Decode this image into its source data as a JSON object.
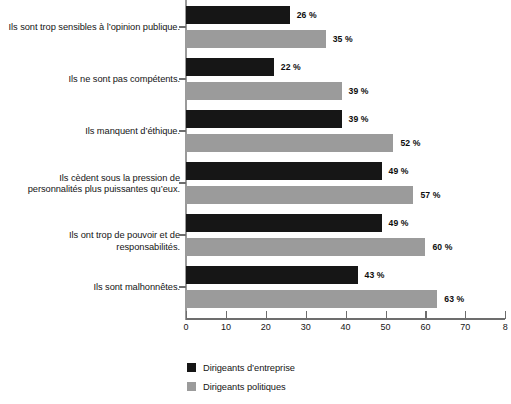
{
  "chart_data": {
    "type": "bar",
    "orientation": "horizontal",
    "title": "",
    "xlabel": "",
    "ylabel": "",
    "xlim": [
      0,
      80
    ],
    "xticks": [
      0,
      10,
      20,
      30,
      40,
      50,
      60,
      70,
      80
    ],
    "xtick_labels": [
      "0",
      "10",
      "20",
      "30",
      "40",
      "50",
      "60",
      "70",
      "8"
    ],
    "grid": false,
    "legend_position": "bottom-left",
    "value_suffix": "%",
    "categories": [
      "Ils sont trop sensibles à l’opinion publique.",
      "Ils ne sont pas compétents.",
      "Ils manquent d’éthique.",
      "Ils cèdent sous la pression de\npersonnalités plus puissantes qu’eux.",
      "Ils ont trop de pouvoir et de responsabilités.",
      "Ils sont malhonnêtes."
    ],
    "series": [
      {
        "name": "Dirigeants d’entreprise",
        "color": "#161616",
        "values": [
          26,
          22,
          39,
          49,
          49,
          43
        ],
        "labels": [
          "26 %",
          "22 %",
          "39 %",
          "49 %",
          "49 %",
          "43 %"
        ]
      },
      {
        "name": "Dirigeants politiques",
        "color": "#9b9b9b",
        "values": [
          35,
          39,
          52,
          57,
          60,
          63
        ],
        "labels": [
          "35 %",
          "39 %",
          "52 %",
          "57 %",
          "60 %",
          "63 %"
        ]
      }
    ]
  }
}
